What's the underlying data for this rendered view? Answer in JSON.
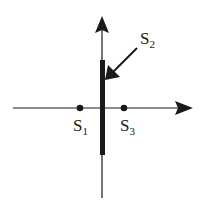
{
  "diagram": {
    "colors": {
      "ink": "#1a1a1a",
      "background": "#ffffff"
    },
    "axes": {
      "horizontal": {
        "x1": 13,
        "x2": 180,
        "y": 108,
        "arrow_tip_x": 193
      },
      "vertical": {
        "x": 102,
        "y1": 198,
        "y2": 30,
        "arrow_tip_y": 16
      }
    },
    "thick_segment": {
      "x": 100,
      "y": 60,
      "width": 5,
      "height": 95
    },
    "points": [
      {
        "id": "S1",
        "cx": 80,
        "cy": 108,
        "label_main": "S",
        "label_sub": "1",
        "label_x": 73,
        "label_y": 131
      },
      {
        "id": "S3",
        "cx": 124,
        "cy": 108,
        "label_main": "S",
        "label_sub": "3",
        "label_x": 120,
        "label_y": 131
      }
    ],
    "pointer": {
      "id": "S2",
      "label_main": "S",
      "label_sub": "2",
      "label_x": 140,
      "label_y": 47,
      "from_x": 137,
      "from_y": 48,
      "to_x": 106,
      "to_y": 79
    }
  }
}
